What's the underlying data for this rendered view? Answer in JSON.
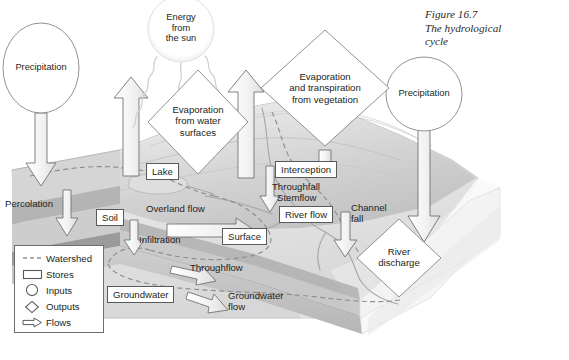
{
  "figure": {
    "number": "Figure 16.7",
    "title_line1": "The hydrological",
    "title_line2": "cycle"
  },
  "inputs": [
    {
      "id": "precipitation-left",
      "label": "Precipitation",
      "shape": "circle"
    },
    {
      "id": "energy-from-the-sun",
      "label_line1": "Energy",
      "label_line2": "from",
      "label_line3": "the sun",
      "shape": "circle"
    },
    {
      "id": "precipitation-right",
      "label": "Precipitation",
      "shape": "circle"
    }
  ],
  "outputs": [
    {
      "id": "evaporation-water-surfaces",
      "label_line1": "Evaporation",
      "label_line2": "from water",
      "label_line3": "surfaces",
      "shape": "diamond"
    },
    {
      "id": "evapotranspiration-vegetation",
      "label_line1": "Evaporation",
      "label_line2": "and transpiration",
      "label_line3": "from vegetation",
      "shape": "diamond"
    },
    {
      "id": "river-discharge",
      "label_line1": "River",
      "label_line2": "discharge",
      "shape": "diamond"
    }
  ],
  "stores": [
    {
      "id": "lake",
      "label": "Lake"
    },
    {
      "id": "soil",
      "label": "Soil"
    },
    {
      "id": "surface",
      "label": "Surface"
    },
    {
      "id": "interception",
      "label": "Interception"
    },
    {
      "id": "river-flow",
      "label": "River flow"
    },
    {
      "id": "groundwater",
      "label": "Groundwater"
    }
  ],
  "flows": [
    {
      "id": "percolation",
      "label": "Percolation"
    },
    {
      "id": "overland-flow",
      "label": "Overland flow"
    },
    {
      "id": "infiltration",
      "label": "Infiltration"
    },
    {
      "id": "throughfall",
      "label": "Throughfall"
    },
    {
      "id": "stemflow",
      "label": "Stemflow"
    },
    {
      "id": "channel-fall",
      "label_line1": "Channel",
      "label_line2": "fall"
    },
    {
      "id": "throughflow",
      "label": "Throughflow"
    },
    {
      "id": "groundwater-flow",
      "label_line1": "Groundwater",
      "label_line2": "flow"
    }
  ],
  "legend": {
    "items": [
      {
        "key": "watershed-dashes",
        "label": "Watershed"
      },
      {
        "key": "store-rectangle",
        "label": "Stores"
      },
      {
        "key": "input-circle",
        "label": "Inputs"
      },
      {
        "key": "output-diamond",
        "label": "Outputs"
      },
      {
        "key": "flow-arrow",
        "label": "Flows"
      }
    ]
  },
  "colors": {
    "ink": "#231f20",
    "outline": "#58595b",
    "terrain_light": "#e9e9e9",
    "terrain_mid": "#c9c9c9",
    "terrain_dark": "#a9a9a9",
    "arrow_fill": "#ffffff",
    "page": "#ffffff"
  }
}
